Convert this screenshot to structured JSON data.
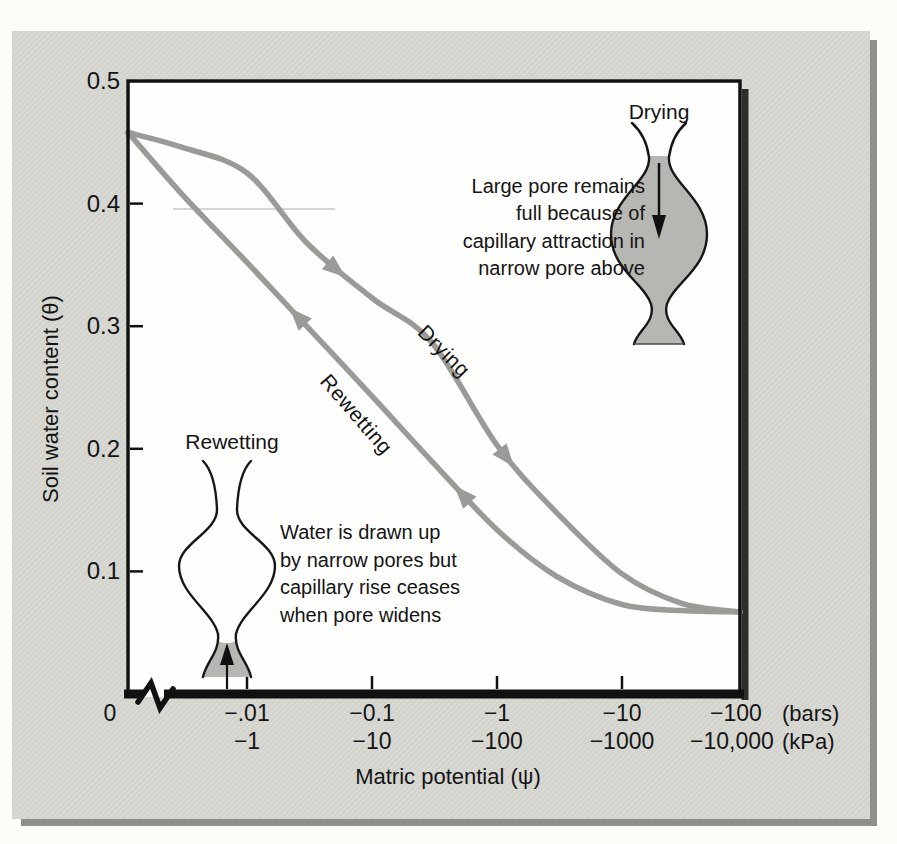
{
  "figure": {
    "y_axis": {
      "title": "Soil water content (θ)",
      "tick_labels": [
        "0.5",
        "0.4",
        "0.3",
        "0.2",
        "0.1"
      ]
    },
    "x_axis": {
      "title": "Matric potential (ψ)",
      "origin_label": "0",
      "bars_ticks": [
        "−.01",
        "−0.1",
        "−1",
        "−10",
        "−100"
      ],
      "bars_unit": "(bars)",
      "kpa_ticks": [
        "−1",
        "−10",
        "−100",
        "−1000",
        "−10,000"
      ],
      "kpa_unit": "(kPa)"
    },
    "curve_labels": {
      "drying": "Drying",
      "rewetting": "Rewetting"
    },
    "pore_drying": {
      "label": "Drying",
      "caption_lines": [
        "Large pore remains",
        "full because of",
        "capillary attraction in",
        "narrow pore above"
      ]
    },
    "pore_rewetting": {
      "label": "Rewetting",
      "caption_lines": [
        "Water is drawn up",
        "by narrow pores but",
        "capillary rise ceases",
        "when pore widens"
      ]
    },
    "colors": {
      "curve": "#9a9a97",
      "pore_fill": "#b6b6b2",
      "panel_bg": "#d7d7d2",
      "plot_bg": "#fefefc",
      "panel_shadow": "#8f8f8b",
      "plot_shadow": "#2e2e2b",
      "ink": "#141414"
    }
  },
  "chart_data": {
    "type": "line",
    "title": "",
    "xlabel": "Matric potential (ψ)",
    "ylabel": "Soil water content (θ)",
    "x_scale": "logarithmic in negative potential with axis break between 0 and −.01 bars",
    "x_ticks_bars": [
      -0.01,
      -0.1,
      -1,
      -10,
      -100
    ],
    "x_ticks_kpa": [
      -1,
      -10,
      -100,
      -1000,
      -10000
    ],
    "ylim": [
      0,
      0.5
    ],
    "legend_position": "labels along curves",
    "x_bars": [
      0,
      -0.003,
      -0.01,
      -0.03,
      -0.1,
      -0.3,
      -1,
      -3,
      -10,
      -30,
      -100
    ],
    "series": [
      {
        "name": "Drying",
        "values": [
          0.458,
          0.446,
          0.425,
          0.368,
          0.323,
          0.287,
          0.203,
          0.148,
          0.098,
          0.074,
          0.067
        ]
      },
      {
        "name": "Rewetting",
        "values": [
          0.458,
          0.408,
          0.352,
          0.3,
          0.243,
          0.19,
          0.134,
          0.096,
          0.073,
          0.068,
          0.067
        ]
      }
    ],
    "annotations": [
      "Large pore remains full because of capillary attraction in narrow pore above",
      "Water is drawn up by narrow pores but capillary rise ceases when pore widens"
    ]
  }
}
